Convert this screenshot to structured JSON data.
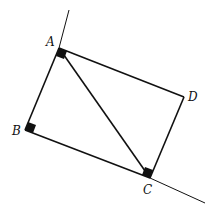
{
  "diagram": {
    "type": "geometry",
    "colors": {
      "stroke": "#111111",
      "background": "#ffffff"
    },
    "points": {
      "A": {
        "label": "A",
        "x": 59,
        "y": 48
      },
      "B": {
        "label": "B",
        "x": 25,
        "y": 130
      },
      "C": {
        "label": "C",
        "x": 150,
        "y": 178
      },
      "D": {
        "label": "D",
        "x": 184,
        "y": 97
      }
    },
    "segments": [
      {
        "from": "A",
        "to": "B"
      },
      {
        "from": "B",
        "to": "C"
      },
      {
        "from": "C",
        "to": "D"
      },
      {
        "from": "D",
        "to": "A"
      },
      {
        "from": "A",
        "to": "C"
      }
    ],
    "extended_line": {
      "start": {
        "x": 69,
        "y": 10
      },
      "end": {
        "x": 205,
        "y": 203
      }
    },
    "right_angle_markers": [
      "A",
      "B",
      "C"
    ],
    "labels": {
      "A": "A",
      "B": "B",
      "C": "C",
      "D": "D"
    }
  }
}
